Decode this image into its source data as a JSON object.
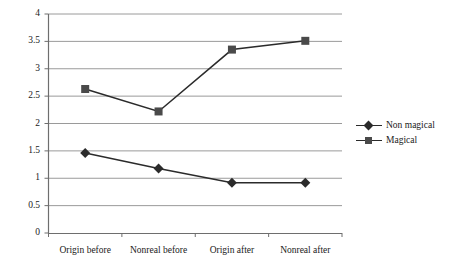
{
  "chart_data": {
    "type": "line",
    "title": "",
    "subtitle": "",
    "xlabel": "",
    "ylabel": "",
    "categories": [
      "Origin before",
      "Nonreal before",
      "Origin after",
      "Nonreal after"
    ],
    "series": [
      {
        "name": "Non magical",
        "marker": "diamond",
        "color": "#2b2b2b",
        "values": [
          1.46,
          1.18,
          0.92,
          0.92
        ]
      },
      {
        "name": "Magical",
        "marker": "square",
        "color": "#4a4a4a",
        "values": [
          2.63,
          2.22,
          3.35,
          3.51
        ]
      }
    ],
    "ylim": [
      0,
      4
    ],
    "yticks": [
      0,
      0.5,
      1,
      1.5,
      2,
      2.5,
      3,
      3.5,
      4
    ],
    "ytick_labels": [
      "0",
      "0.5",
      "1",
      "1.5",
      "2",
      "2.5",
      "3",
      "3.5",
      "4"
    ],
    "grid": true,
    "grid_axis": "y",
    "grid_color": "#9a9a9a",
    "axis_color": "#6e6e6e",
    "legend_position": "right",
    "legend_entries": [
      "Non magical",
      "Magical"
    ]
  },
  "legend": {
    "entries": [
      {
        "label": "Non magical"
      },
      {
        "label": "Magical"
      }
    ]
  }
}
